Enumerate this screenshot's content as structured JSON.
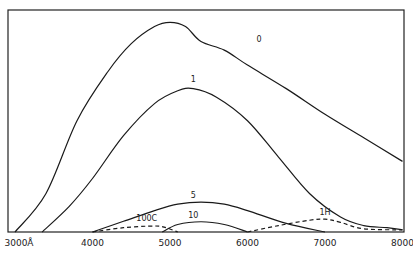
{
  "chart_data": {
    "type": "line",
    "title": "",
    "xlabel": "Wavelength (Å)",
    "ylabel": "",
    "xlim": [
      3000,
      8000
    ],
    "ylim": [
      0,
      100
    ],
    "grid": false,
    "legend": "inline labels",
    "x_ticks": [
      3000,
      4000,
      5000,
      6000,
      7000,
      8000
    ],
    "x_tick_labels": [
      "3000Å",
      "4000",
      "5000",
      "6000",
      "7000",
      "8000"
    ],
    "series": [
      {
        "name": "0",
        "style": "solid",
        "x": [
          3000,
          3400,
          3800,
          4200,
          4500,
          4800,
          5000,
          5200,
          5400,
          5700,
          6000,
          6500,
          7000,
          7500,
          8000
        ],
        "y": [
          0,
          18,
          52,
          75,
          88,
          96,
          98,
          96,
          89,
          85,
          78,
          67,
          55,
          44,
          33
        ]
      },
      {
        "name": "1",
        "style": "solid",
        "x": [
          3350,
          3700,
          4000,
          4400,
          4800,
          5100,
          5300,
          5600,
          6000,
          6400,
          6800,
          7200,
          7500,
          7800,
          8000
        ],
        "y": [
          0,
          12,
          25,
          45,
          60,
          66,
          67,
          63,
          52,
          35,
          18,
          7,
          3,
          2,
          1
        ]
      },
      {
        "name": "5",
        "style": "solid",
        "x": [
          4000,
          4400,
          4800,
          5100,
          5400,
          5700,
          6000,
          6500,
          7000
        ],
        "y": [
          0,
          5,
          10,
          13,
          14,
          13,
          10,
          4,
          0
        ]
      },
      {
        "name": "10",
        "style": "solid",
        "x": [
          4900,
          5100,
          5400,
          5700,
          6000
        ],
        "y": [
          0,
          3.5,
          4.8,
          3.5,
          0
        ]
      },
      {
        "name": "100C",
        "style": "dashed",
        "x": [
          4000,
          4400,
          4800,
          4950,
          5100
        ],
        "y": [
          0,
          2,
          2.8,
          2,
          0
        ]
      },
      {
        "name": "1H",
        "style": "dashed",
        "x": [
          6000,
          6400,
          6800,
          7000,
          7200,
          7500,
          8000
        ],
        "y": [
          0,
          3,
          5.5,
          6,
          4.5,
          1.5,
          1
        ]
      }
    ],
    "labels": [
      {
        "text": "0",
        "x": 6150,
        "y": 89
      },
      {
        "text": "1",
        "x": 5300,
        "y": 70
      },
      {
        "text": "5",
        "x": 5300,
        "y": 16
      },
      {
        "text": "10",
        "x": 5300,
        "y": 6.5
      },
      {
        "text": "100C",
        "x": 4700,
        "y": 5
      },
      {
        "text": "1H",
        "x": 7000,
        "y": 8
      }
    ]
  }
}
